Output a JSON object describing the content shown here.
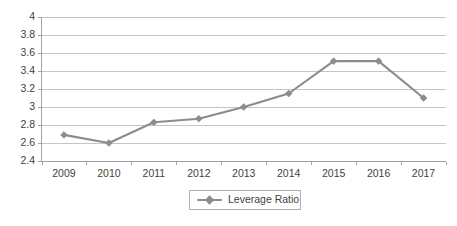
{
  "chart_data": {
    "type": "line",
    "title": "",
    "xlabel": "",
    "ylabel": "",
    "categories": [
      "2009",
      "2010",
      "2011",
      "2012",
      "2013",
      "2014",
      "2015",
      "2016",
      "2017"
    ],
    "series": [
      {
        "name": "Leverage Ratio",
        "values": [
          2.69,
          2.6,
          2.83,
          2.87,
          3.0,
          3.15,
          3.51,
          3.51,
          3.1
        ],
        "color": "#8c8c8c",
        "marker": "diamond"
      }
    ],
    "ylim": [
      2.4,
      4.0
    ],
    "ytick_step": 0.2,
    "ytick_labels": [
      "4",
      "3.8",
      "3.6",
      "3.4",
      "3.2",
      "3",
      "2.8",
      "2.6",
      "2.4"
    ],
    "ytick_values": [
      4,
      3.8,
      3.6,
      3.4,
      3.2,
      3,
      2.8,
      2.6,
      2.4
    ],
    "grid": true,
    "grid_axis": "y",
    "grid_color": "#b6b6b6",
    "axis_color": "#9a9a9a",
    "background": "#ffffff",
    "legend": {
      "position": "bottom",
      "entries": [
        "Leverage Ratio"
      ],
      "border_color": "#a6a6a6"
    }
  }
}
